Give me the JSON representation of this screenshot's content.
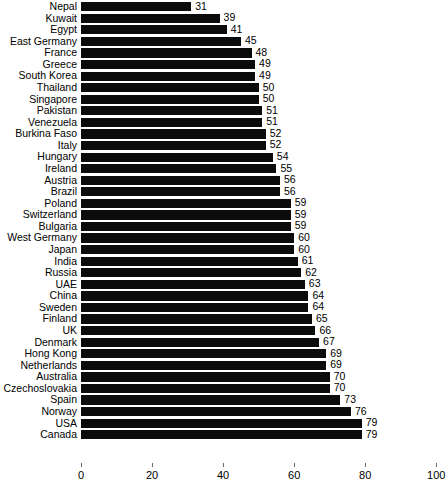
{
  "chart_data": {
    "type": "bar",
    "orientation": "horizontal",
    "title": "",
    "subtitle": "",
    "xlabel": "",
    "ylabel": "",
    "xlim": [
      0,
      100
    ],
    "grid": false,
    "legend": null,
    "xticks": [
      "0",
      "20",
      "40",
      "60",
      "80",
      "100"
    ],
    "xtick_values": [
      0,
      20,
      40,
      60,
      80,
      100
    ],
    "bar_color": "#0b0b0b",
    "show_value_labels": true,
    "categories": [
      "Nepal",
      "Kuwait",
      "Egypt",
      "East Germany",
      "France",
      "Greece",
      "South Korea",
      "Thailand",
      "Singapore",
      "Pakistan",
      "Venezuela",
      "Burkina Faso",
      "Italy",
      "Hungary",
      "Ireland",
      "Austria",
      "Brazil",
      "Poland",
      "Switzerland",
      "Bulgaria",
      "West Germany",
      "Japan",
      "India",
      "Russia",
      "UAE",
      "China",
      "Sweden",
      "Finland",
      "UK",
      "Denmark",
      "Hong Kong",
      "Netherlands",
      "Australia",
      "Czechoslovakia",
      "Spain",
      "Norway",
      "USA",
      "Canada"
    ],
    "values": [
      31,
      39,
      41,
      45,
      48,
      49,
      49,
      50,
      50,
      51,
      51,
      52,
      52,
      54,
      55,
      56,
      56,
      59,
      59,
      59,
      60,
      60,
      61,
      62,
      63,
      64,
      64,
      65,
      66,
      67,
      69,
      69,
      70,
      70,
      73,
      76,
      79,
      79
    ],
    "value_labels": [
      "31",
      "39",
      "41",
      "45",
      "48",
      "49",
      "49",
      "50",
      "50",
      "51",
      "51",
      "52",
      "52",
      "54",
      "55",
      "56",
      "56",
      "59",
      "59",
      "59",
      "60",
      "60",
      "61",
      "62",
      "63",
      "64",
      "64",
      "65",
      "66",
      "67",
      "69",
      "69",
      "70",
      "70",
      "73",
      "76",
      "79",
      "79"
    ]
  }
}
